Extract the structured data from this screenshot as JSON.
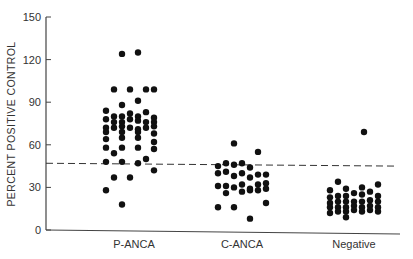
{
  "chart_data": {
    "type": "scatter",
    "title": "",
    "xlabel": "",
    "ylabel": "PERCENT POSITIVE CONTROL",
    "ylim": [
      0,
      150
    ],
    "yticks": [
      0,
      30,
      60,
      90,
      120,
      150
    ],
    "grid": false,
    "legend": null,
    "categories": [
      "P-ANCA",
      "C-ANCA",
      "Negative"
    ],
    "threshold": {
      "value": 47,
      "style": "dashed",
      "end_value": 45
    },
    "series": [
      {
        "name": "P-ANCA",
        "points": [
          {
            "dx": -12,
            "v": 124
          },
          {
            "dx": 4,
            "v": 125
          },
          {
            "dx": -20,
            "v": 99
          },
          {
            "dx": -4,
            "v": 99
          },
          {
            "dx": 12,
            "v": 99
          },
          {
            "dx": 20,
            "v": 99
          },
          {
            "dx": -12,
            "v": 88
          },
          {
            "dx": 4,
            "v": 91
          },
          {
            "dx": -28,
            "v": 84
          },
          {
            "dx": -20,
            "v": 80
          },
          {
            "dx": -12,
            "v": 80
          },
          {
            "dx": -4,
            "v": 82
          },
          {
            "dx": 4,
            "v": 80
          },
          {
            "dx": 12,
            "v": 83
          },
          {
            "dx": 20,
            "v": 79
          },
          {
            "dx": -28,
            "v": 78
          },
          {
            "dx": -20,
            "v": 76
          },
          {
            "dx": -12,
            "v": 76
          },
          {
            "dx": -4,
            "v": 78
          },
          {
            "dx": 4,
            "v": 77
          },
          {
            "dx": 12,
            "v": 76
          },
          {
            "dx": 20,
            "v": 76
          },
          {
            "dx": -28,
            "v": 72
          },
          {
            "dx": -20,
            "v": 72
          },
          {
            "dx": -12,
            "v": 73
          },
          {
            "dx": -4,
            "v": 72
          },
          {
            "dx": 4,
            "v": 71
          },
          {
            "dx": 12,
            "v": 72
          },
          {
            "dx": 20,
            "v": 73
          },
          {
            "dx": -28,
            "v": 69
          },
          {
            "dx": -12,
            "v": 69
          },
          {
            "dx": 4,
            "v": 69
          },
          {
            "dx": 20,
            "v": 68
          },
          {
            "dx": -28,
            "v": 64
          },
          {
            "dx": -12,
            "v": 65
          },
          {
            "dx": 4,
            "v": 65
          },
          {
            "dx": 20,
            "v": 62
          },
          {
            "dx": -28,
            "v": 58
          },
          {
            "dx": -20,
            "v": 54
          },
          {
            "dx": -12,
            "v": 58
          },
          {
            "dx": 4,
            "v": 58
          },
          {
            "dx": 20,
            "v": 57
          },
          {
            "dx": -28,
            "v": 48
          },
          {
            "dx": -12,
            "v": 48
          },
          {
            "dx": 4,
            "v": 47
          },
          {
            "dx": 12,
            "v": 50
          },
          {
            "dx": 20,
            "v": 42
          },
          {
            "dx": -20,
            "v": 37
          },
          {
            "dx": -4,
            "v": 37
          },
          {
            "dx": -28,
            "v": 28
          },
          {
            "dx": -12,
            "v": 18
          }
        ]
      },
      {
        "name": "C-ANCA",
        "points": [
          {
            "dx": -8,
            "v": 61
          },
          {
            "dx": 16,
            "v": 55
          },
          {
            "dx": -24,
            "v": 45
          },
          {
            "dx": -16,
            "v": 47
          },
          {
            "dx": -8,
            "v": 46
          },
          {
            "dx": 0,
            "v": 47
          },
          {
            "dx": 8,
            "v": 44
          },
          {
            "dx": -24,
            "v": 40
          },
          {
            "dx": -16,
            "v": 41
          },
          {
            "dx": -8,
            "v": 38
          },
          {
            "dx": 0,
            "v": 40
          },
          {
            "dx": 8,
            "v": 37
          },
          {
            "dx": 16,
            "v": 39
          },
          {
            "dx": 24,
            "v": 39
          },
          {
            "dx": -24,
            "v": 31
          },
          {
            "dx": -16,
            "v": 31
          },
          {
            "dx": -8,
            "v": 30
          },
          {
            "dx": 0,
            "v": 32
          },
          {
            "dx": 8,
            "v": 29
          },
          {
            "dx": 16,
            "v": 32
          },
          {
            "dx": 24,
            "v": 33
          },
          {
            "dx": -16,
            "v": 26
          },
          {
            "dx": 0,
            "v": 27
          },
          {
            "dx": 8,
            "v": 28
          },
          {
            "dx": 16,
            "v": 28
          },
          {
            "dx": 24,
            "v": 29
          },
          {
            "dx": -24,
            "v": 16
          },
          {
            "dx": -8,
            "v": 16
          },
          {
            "dx": 24,
            "v": 19
          },
          {
            "dx": 8,
            "v": 8
          }
        ]
      },
      {
        "name": "Negative",
        "points": [
          {
            "dx": 10,
            "v": 69
          },
          {
            "dx": -16,
            "v": 34
          },
          {
            "dx": -24,
            "v": 28
          },
          {
            "dx": -8,
            "v": 29
          },
          {
            "dx": 8,
            "v": 30
          },
          {
            "dx": 24,
            "v": 32
          },
          {
            "dx": -24,
            "v": 23
          },
          {
            "dx": -16,
            "v": 24
          },
          {
            "dx": -8,
            "v": 24
          },
          {
            "dx": 0,
            "v": 26
          },
          {
            "dx": 8,
            "v": 25
          },
          {
            "dx": 16,
            "v": 27
          },
          {
            "dx": 24,
            "v": 24
          },
          {
            "dx": -24,
            "v": 19
          },
          {
            "dx": -16,
            "v": 20
          },
          {
            "dx": -8,
            "v": 20
          },
          {
            "dx": 0,
            "v": 20
          },
          {
            "dx": 8,
            "v": 20
          },
          {
            "dx": 16,
            "v": 21
          },
          {
            "dx": 24,
            "v": 20
          },
          {
            "dx": -24,
            "v": 16
          },
          {
            "dx": -16,
            "v": 16
          },
          {
            "dx": -8,
            "v": 16
          },
          {
            "dx": 0,
            "v": 17
          },
          {
            "dx": 8,
            "v": 16
          },
          {
            "dx": 16,
            "v": 17
          },
          {
            "dx": 24,
            "v": 16
          },
          {
            "dx": -24,
            "v": 12
          },
          {
            "dx": -16,
            "v": 13
          },
          {
            "dx": -8,
            "v": 13
          },
          {
            "dx": 0,
            "v": 14
          },
          {
            "dx": 8,
            "v": 13
          },
          {
            "dx": 16,
            "v": 14
          },
          {
            "dx": 24,
            "v": 13
          },
          {
            "dx": -8,
            "v": 9
          }
        ]
      }
    ]
  },
  "layout": {
    "plot": {
      "x0": 46,
      "y_top": 17,
      "y_zero": 230,
      "x_end": 400
    },
    "category_x": [
      134,
      242,
      354
    ],
    "dot_radius": 3.2,
    "dot_color": "#111111",
    "axis_color": "#444444"
  }
}
